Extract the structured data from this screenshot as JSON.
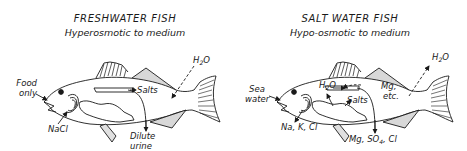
{
  "figure": {
    "panels": [
      {
        "id": "freshwater",
        "title": "FRESHWATER FISH",
        "subtitle": "Hyperosmotic to medium",
        "labels": {
          "water_in": {
            "main": "H",
            "sub": "2",
            "tail": "O"
          },
          "mouth": [
            "Food",
            "only"
          ],
          "gill": "NaCl",
          "salts": "Salts",
          "urine": [
            "Dilute",
            "urine"
          ]
        },
        "arrows": [
          {
            "from": "H2O",
            "to": "body",
            "direction": "in"
          },
          {
            "from": "Food only",
            "to": "mouth",
            "direction": "in"
          },
          {
            "from": "NaCl",
            "to": "gills",
            "direction": "in"
          },
          {
            "from": "kidney",
            "to": "Salts",
            "direction": "retained"
          },
          {
            "from": "kidney",
            "to": "Dilute urine",
            "direction": "out"
          }
        ]
      },
      {
        "id": "saltwater",
        "title": "SALT WATER FISH",
        "subtitle": "Hypo-osmotic to medium",
        "labels": {
          "water_out": {
            "main": "H",
            "sub": "2",
            "tail": "O"
          },
          "mouth": [
            "Sea",
            "water"
          ],
          "gill": "Na, K, Cl",
          "gut_water": {
            "main": "H",
            "sub": "2",
            "tail": "O"
          },
          "mg": [
            "Mg,",
            "etc."
          ],
          "salts": "Salts",
          "urine": {
            "main": "Mg, SO",
            "sub": "4",
            "tail": ", Cl"
          }
        },
        "arrows": [
          {
            "from": "body",
            "to": "H2O",
            "direction": "out"
          },
          {
            "from": "Sea water",
            "to": "mouth",
            "direction": "in"
          },
          {
            "from": "gills",
            "to": "Na, K, Cl",
            "direction": "out"
          },
          {
            "from": "gut",
            "to": "H2O",
            "direction": "absorbed"
          },
          {
            "from": "Mg, etc.",
            "to": "gut",
            "direction": "retained"
          },
          {
            "from": "gut",
            "to": "Salts",
            "direction": "absorbed"
          },
          {
            "from": "kidney",
            "to": "Mg, SO4, Cl",
            "direction": "out"
          }
        ]
      }
    ]
  },
  "colors": {
    "ink": "#1a1a1a",
    "background": "#ffffff",
    "fill": "#ffffff"
  }
}
